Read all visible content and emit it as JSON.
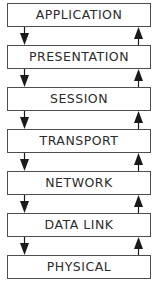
{
  "diagram": {
    "geometry": {
      "width_px": 159,
      "height_px": 294,
      "box_left_px": 7,
      "box_width_px": 146,
      "box_height_px": 24,
      "gap_px": 18,
      "first_box_top_px": 3,
      "arrow_down_x_px": 19,
      "arrow_up_x_px": 133
    },
    "colors": {
      "background": "#ffffff",
      "box_fill": "#ffffff",
      "box_border": "#4d4d4d",
      "text": "#2b2b2b",
      "arrow": "#1a1a1a"
    },
    "layers": [
      {
        "label": "APPLICATION",
        "top_px": 3
      },
      {
        "label": "PRESENTATION",
        "top_px": 45
      },
      {
        "label": "SESSION",
        "top_px": 87
      },
      {
        "label": "TRANSPORT",
        "top_px": 129
      },
      {
        "label": "NETWORK",
        "top_px": 171
      },
      {
        "label": "DATA LINK",
        "top_px": 213
      },
      {
        "label": "PHYSICAL",
        "top_px": 255
      }
    ],
    "connectors": [
      {
        "top_px": 27,
        "down_icon": "arrow-down-icon",
        "up_icon": "arrow-up-icon"
      },
      {
        "top_px": 69,
        "down_icon": "arrow-down-icon",
        "up_icon": "arrow-up-icon"
      },
      {
        "top_px": 111,
        "down_icon": "arrow-down-icon",
        "up_icon": "arrow-up-icon"
      },
      {
        "top_px": 153,
        "down_icon": "arrow-down-icon",
        "up_icon": "arrow-up-icon"
      },
      {
        "top_px": 195,
        "down_icon": "arrow-down-icon",
        "up_icon": "arrow-up-icon"
      },
      {
        "top_px": 237,
        "down_icon": "arrow-down-icon",
        "up_icon": "arrow-up-icon"
      }
    ]
  }
}
